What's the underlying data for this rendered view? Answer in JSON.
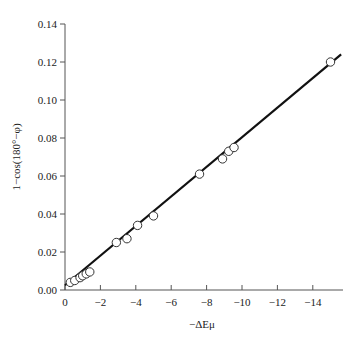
{
  "chart_data": {
    "type": "scatter",
    "title": "",
    "xlabel": "−ΔEμ",
    "ylabel": "1−cos(180°−φ)",
    "xlim": [
      0,
      -15.8
    ],
    "ylim": [
      0,
      0.14
    ],
    "x_ticks": [
      0,
      -2,
      -4,
      -6,
      -8,
      -10,
      -12,
      -14
    ],
    "x_tick_labels": [
      "0",
      "−2",
      "−4",
      "−6",
      "−8",
      "−10",
      "−12",
      "−14"
    ],
    "y_ticks": [
      0.0,
      0.02,
      0.04,
      0.06,
      0.08,
      0.1,
      0.12,
      0.14
    ],
    "y_tick_labels": [
      "0.00",
      "0.02",
      "0.04",
      "0.06",
      "0.08",
      "0.10",
      "0.12",
      "0.14"
    ],
    "grid": false,
    "legend": null,
    "series": [
      {
        "name": "data",
        "marker": "open-circle",
        "x": [
          -0.3,
          -0.55,
          -0.85,
          -1.0,
          -1.2,
          -1.4,
          -2.9,
          -3.5,
          -4.1,
          -5.0,
          -7.6,
          -8.9,
          -9.25,
          -9.55,
          -15.0
        ],
        "y": [
          0.004,
          0.005,
          0.0065,
          0.0075,
          0.0085,
          0.0095,
          0.025,
          0.027,
          0.034,
          0.039,
          0.061,
          0.069,
          0.073,
          0.075,
          0.12
        ]
      },
      {
        "name": "linear fit",
        "marker": "line",
        "x": [
          0,
          -15.6
        ],
        "y": [
          0.0025,
          0.124
        ]
      }
    ]
  },
  "colors": {
    "axis": "#555555",
    "line": "#111111",
    "marker_edge": "#333333",
    "marker_fill": "#ffffff"
  }
}
